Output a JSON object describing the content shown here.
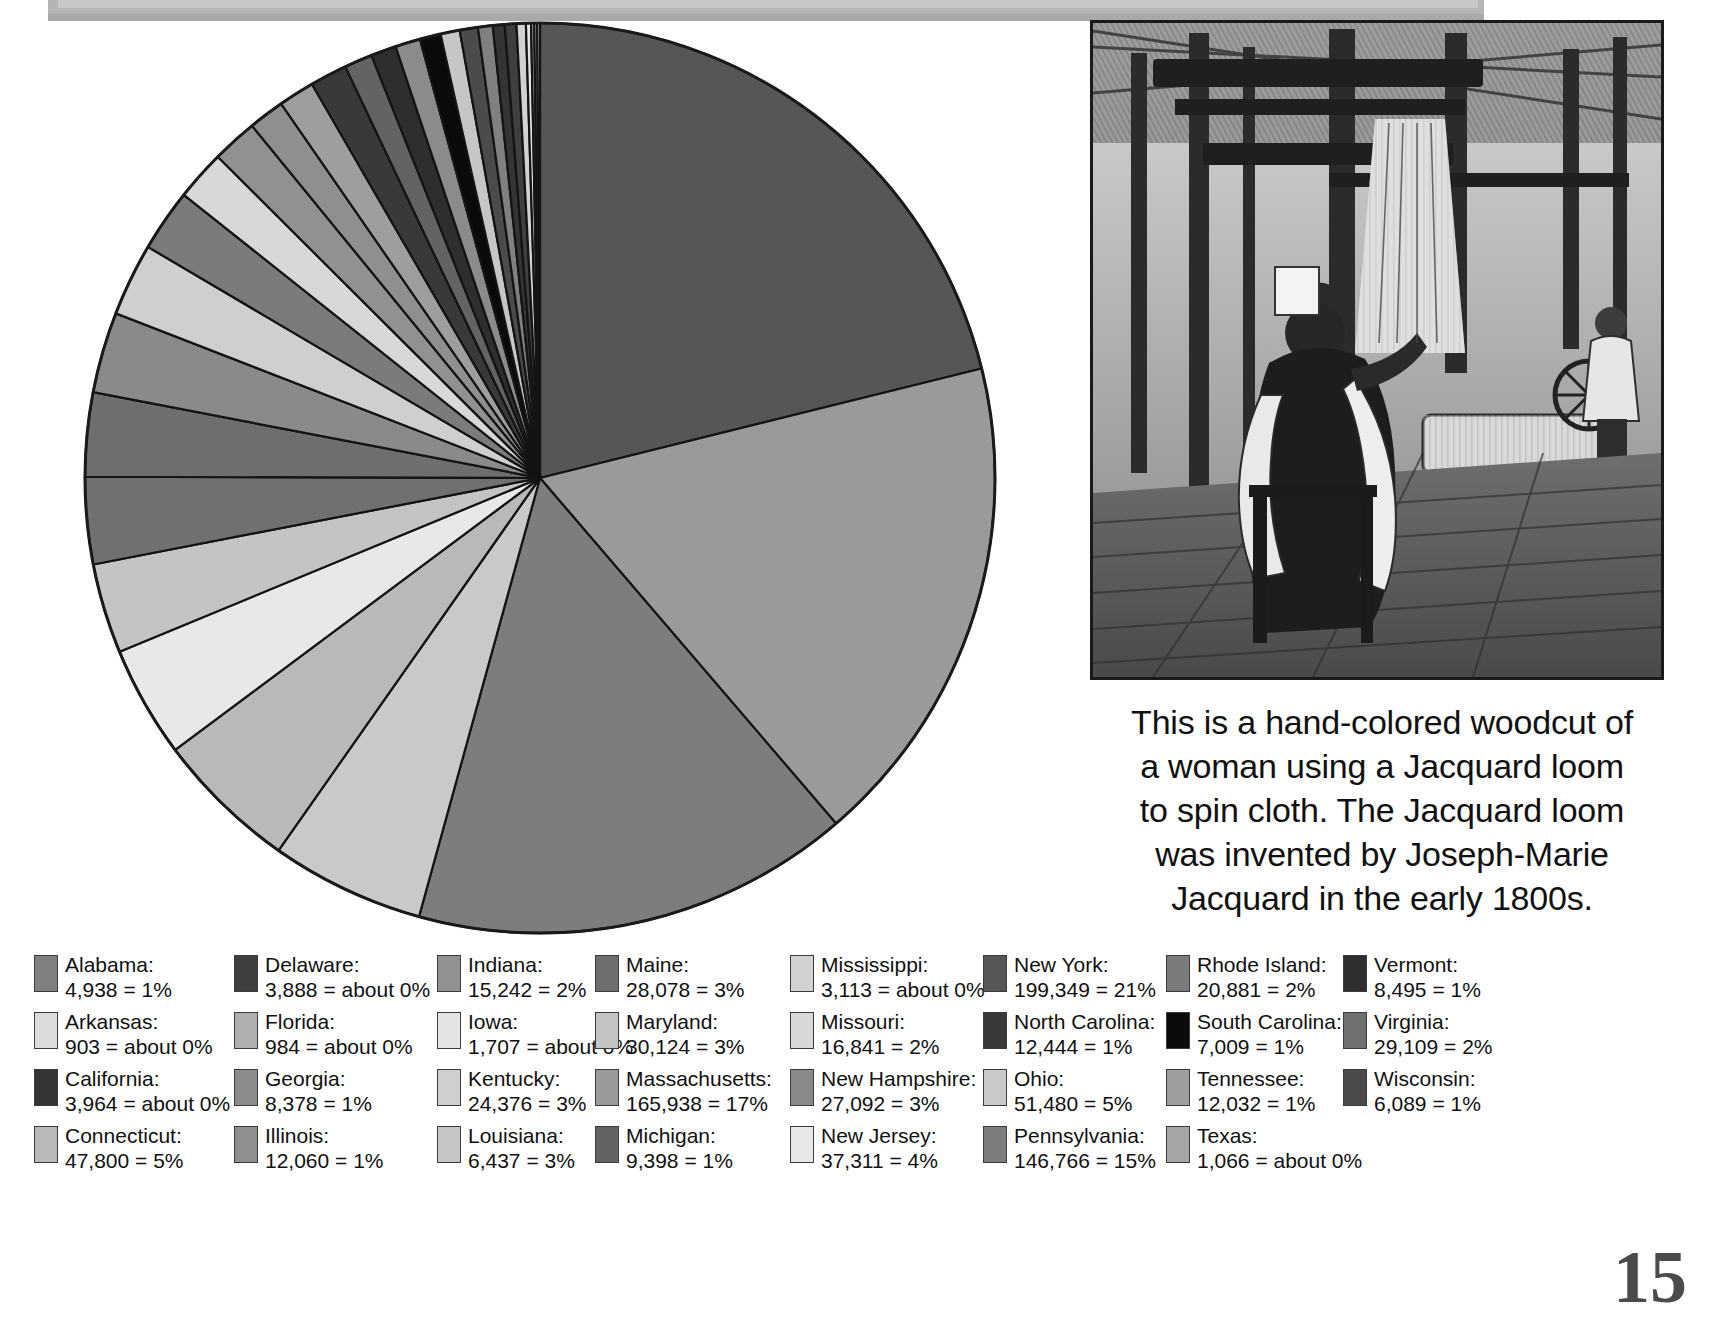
{
  "page": {
    "number": "15"
  },
  "topbar": {
    "present": true
  },
  "photo": {
    "alt_name": "jacquard-loom-woodcut"
  },
  "caption": {
    "lines": [
      "This is a hand-colored woodcut of",
      "a woman using a Jacquard loom",
      "to spin cloth. The Jacquard loom",
      "was invented by Joseph-Marie",
      "Jacquard in the early 1800s."
    ]
  },
  "legend": {
    "rows": [
      [
        {
          "name": "Alabama:",
          "value": "4,938 = 1%",
          "color": "#808080"
        },
        {
          "name": "Delaware:",
          "value": "3,888 = about 0%",
          "color": "#3f3f3f"
        },
        {
          "name": "Indiana:",
          "value": "15,242 = 2%",
          "color": "#919191"
        },
        {
          "name": "Maine:",
          "value": "28,078 = 3%",
          "color": "#6e6e6e"
        },
        {
          "name": "Mississippi:",
          "value": "3,113 = about 0%",
          "color": "#d2d2d2"
        },
        {
          "name": "New York:",
          "value": "199,349 = 21%",
          "color": "#565656"
        },
        {
          "name": "Rhode Island:",
          "value": "20,881 = 2%",
          "color": "#7b7b7b"
        },
        {
          "name": "Vermont:",
          "value": "8,495 = 1%",
          "color": "#2e2e2e"
        }
      ],
      [
        {
          "name": "Arkansas:",
          "value": "903 = about 0%",
          "color": "#dcdcdc"
        },
        {
          "name": "Florida:",
          "value": "984 = about 0%",
          "color": "#b0b0b0"
        },
        {
          "name": "Iowa:",
          "value": "1,707 = about 0%",
          "color": "#e4e4e4"
        },
        {
          "name": "Maryland:",
          "value": "30,124 =  3%",
          "color": "#c4c4c4"
        },
        {
          "name": "Missouri:",
          "value": "16,841 = 2%",
          "color": "#d8d8d8"
        },
        {
          "name": "North Carolina:",
          "value": "12,444 = 1%",
          "color": "#393939"
        },
        {
          "name": "South Carolina:",
          "value": "7,009 = 1%",
          "color": "#0a0a0a"
        },
        {
          "name": "Virginia:",
          "value": "29,109 =  2%",
          "color": "#707070"
        }
      ],
      [
        {
          "name": "California:",
          "value": "3,964 = about 0%",
          "color": "#343434"
        },
        {
          "name": "Georgia:",
          "value": "8,378 = 1%",
          "color": "#8b8b8b"
        },
        {
          "name": "Kentucky:",
          "value": "24,376 = 3%",
          "color": "#cfcfcf"
        },
        {
          "name": "Massachusetts:",
          "value": "165,938 = 17%",
          "color": "#9a9a9a"
        },
        {
          "name": "New Hampshire:",
          "value": "27,092 = 3%",
          "color": "#8a8a8a"
        },
        {
          "name": "Ohio:",
          "value": "51,480 = 5%",
          "color": "#c9c9c9"
        },
        {
          "name": "Tennessee:",
          "value": "12,032 = 1%",
          "color": "#9e9e9e"
        },
        {
          "name": "Wisconsin:",
          "value": "6,089 = 1%",
          "color": "#4b4b4b"
        }
      ],
      [
        {
          "name": "Connecticut:",
          "value": "47,800 = 5%",
          "color": "#b9b9b9"
        },
        {
          "name": "Illinois:",
          "value": "12,060 = 1%",
          "color": "#8f8f8f"
        },
        {
          "name": "Louisiana:",
          "value": "6,437 = 3%",
          "color": "#c6c6c6"
        },
        {
          "name": "Michigan:",
          "value": "9,398 =  1%",
          "color": "#636363"
        },
        {
          "name": "New Jersey:",
          "value": "37,311 = 4%",
          "color": "#e8e8e8"
        },
        {
          "name": "Pennsylvania:",
          "value": "146,766 = 15%",
          "color": "#7d7d7d"
        },
        {
          "name": "Texas:",
          "value": "1,066 = about 0%",
          "color": "#a6a6a6"
        }
      ]
    ]
  },
  "chart_data": {
    "type": "pie",
    "title": "",
    "unit": "textile workers",
    "legend_position": "bottom",
    "start_angle_deg": -90,
    "direction": "clockwise",
    "total": 969000,
    "labels": [
      "New York",
      "Massachusetts",
      "Pennsylvania",
      "Ohio",
      "Connecticut",
      "New Jersey",
      "Maryland",
      "Virginia",
      "Maine",
      "New Hampshire",
      "Kentucky",
      "Rhode Island",
      "Missouri",
      "Indiana",
      "Illinois",
      "Tennessee",
      "North Carolina",
      "Michigan",
      "Vermont",
      "Georgia",
      "South Carolina",
      "Louisiana",
      "Wisconsin",
      "Alabama",
      "California",
      "Delaware",
      "Mississippi",
      "Iowa",
      "Texas",
      "Florida",
      "Arkansas"
    ],
    "values": [
      199349,
      165938,
      146766,
      51480,
      47800,
      37311,
      30124,
      29109,
      28078,
      27092,
      24376,
      20881,
      16841,
      15242,
      12060,
      12032,
      12444,
      9398,
      8495,
      8378,
      7009,
      6437,
      6089,
      4938,
      3964,
      3888,
      3113,
      1707,
      1066,
      984,
      903
    ],
    "percents": [
      21,
      17,
      15,
      5,
      5,
      4,
      3,
      2,
      3,
      3,
      3,
      2,
      2,
      2,
      1,
      1,
      1,
      1,
      1,
      1,
      1,
      3,
      1,
      1,
      0,
      0,
      0,
      0,
      0,
      0,
      0
    ],
    "colors": [
      "#565656",
      "#9a9a9a",
      "#7d7d7d",
      "#c9c9c9",
      "#b9b9b9",
      "#e8e8e8",
      "#c4c4c4",
      "#707070",
      "#6e6e6e",
      "#8a8a8a",
      "#cfcfcf",
      "#7b7b7b",
      "#d8d8d8",
      "#919191",
      "#8f8f8f",
      "#9e9e9e",
      "#393939",
      "#636363",
      "#2e2e2e",
      "#8b8b8b",
      "#0a0a0a",
      "#c6c6c6",
      "#4b4b4b",
      "#808080",
      "#343434",
      "#3f3f3f",
      "#d2d2d2",
      "#e4e4e4",
      "#a6a6a6",
      "#b0b0b0",
      "#dcdcdc"
    ]
  }
}
